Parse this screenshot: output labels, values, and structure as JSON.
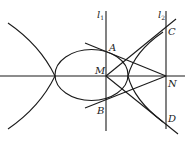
{
  "diagram": {
    "type": "geometry",
    "labels": {
      "l1": {
        "main": "l",
        "sub": "1"
      },
      "l2": {
        "main": "l",
        "sub": "2"
      },
      "A": "A",
      "B": "B",
      "C": "C",
      "D": "D",
      "M": "M",
      "N": "N"
    },
    "stroke_color": "#1a1a1a",
    "background": "#ffffff"
  }
}
